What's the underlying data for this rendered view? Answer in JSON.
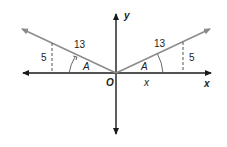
{
  "diagram": {
    "type": "coordinate-plane-reference-angles",
    "axes": {
      "x_label": "x",
      "y_label": "y",
      "origin_label": "O"
    },
    "left_triangle": {
      "hypotenuse_label": "13",
      "opposite_label": "5",
      "angle_label": "A"
    },
    "right_triangle": {
      "hypotenuse_label": "13",
      "opposite_label": "5",
      "angle_label": "A",
      "adjacent_label": "x"
    },
    "colors": {
      "axis": "#1a1a1a",
      "ray": "#8a8a8a",
      "dashed": "#555555"
    }
  }
}
